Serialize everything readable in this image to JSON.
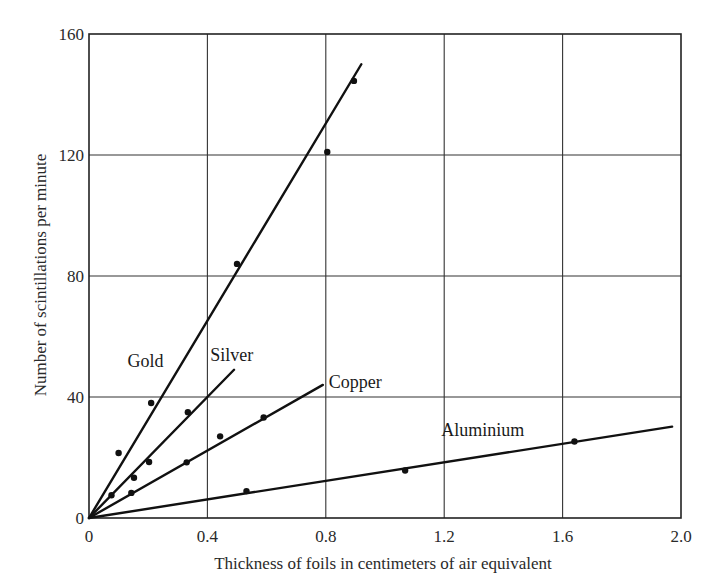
{
  "chart_data": {
    "type": "scatter",
    "title": "",
    "xlabel": "Thickness of foils in centimeters of air equivalent",
    "ylabel": "Number of scintillations per minute",
    "xlim": [
      0,
      2.0
    ],
    "ylim": [
      0,
      160
    ],
    "xticks": [
      0,
      0.4,
      0.8,
      1.2,
      1.6,
      2.0
    ],
    "xtick_labels": [
      "0",
      "0.4",
      "0.8",
      "1.2",
      "1.6",
      "2.0"
    ],
    "yticks": [
      0,
      40,
      80,
      120,
      160
    ],
    "ytick_labels": [
      "0",
      "40",
      "80",
      "120",
      "160"
    ],
    "grid": true,
    "legend": "inline labels",
    "series": [
      {
        "name": "Gold",
        "points": [
          [
            0.1,
            21.5
          ],
          [
            0.21,
            38
          ],
          [
            0.5,
            84
          ],
          [
            0.805,
            121
          ],
          [
            0.895,
            144.5
          ]
        ],
        "fit_line": [
          [
            0,
            0
          ],
          [
            0.92,
            150
          ]
        ],
        "label_pos": [
          0.13,
          50
        ]
      },
      {
        "name": "Silver",
        "points": [
          [
            0.076,
            7.5
          ],
          [
            0.152,
            13.3
          ],
          [
            0.203,
            18.5
          ],
          [
            0.334,
            35
          ]
        ],
        "fit_line": [
          [
            0,
            0
          ],
          [
            0.49,
            49
          ]
        ],
        "label_pos": [
          0.41,
          52
        ]
      },
      {
        "name": "Copper",
        "points": [
          [
            0.143,
            8.3
          ],
          [
            0.33,
            18.4
          ],
          [
            0.443,
            27
          ],
          [
            0.59,
            33.2
          ]
        ],
        "fit_line": [
          [
            0,
            0
          ],
          [
            0.79,
            44
          ]
        ],
        "label_pos": [
          0.81,
          43
        ]
      },
      {
        "name": "Aluminium",
        "points": [
          [
            0.532,
            8.9
          ],
          [
            1.068,
            15.7
          ],
          [
            1.64,
            25.3
          ]
        ],
        "fit_line": [
          [
            0,
            0
          ],
          [
            1.97,
            30.2
          ]
        ],
        "label_pos": [
          1.19,
          27
        ]
      }
    ]
  }
}
